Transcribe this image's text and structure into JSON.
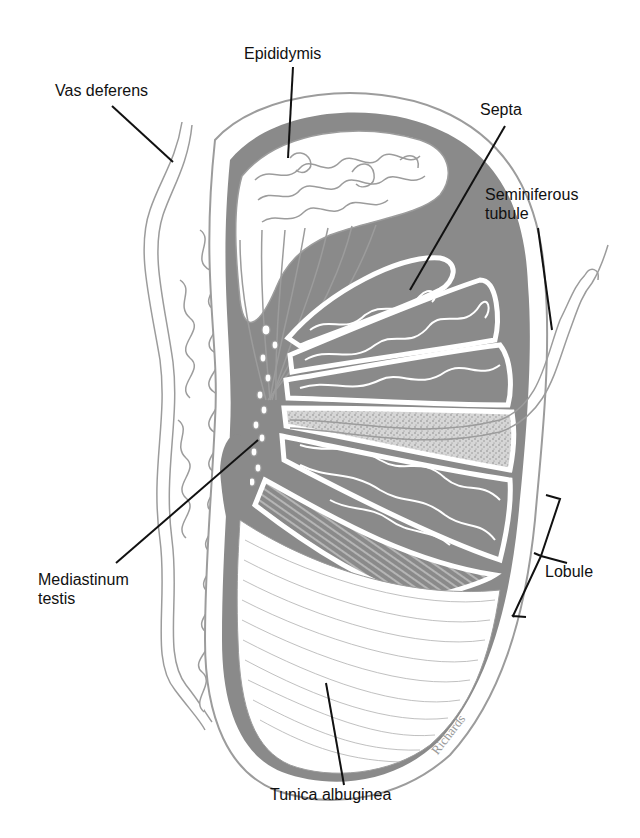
{
  "diagram": {
    "colors": {
      "tunica_fill": "#8a8a8a",
      "outline": "#9c9c9c",
      "leader_line": "#111111",
      "text": "#111111",
      "background": "#ffffff",
      "signature": "#9a9a9a"
    },
    "labels": {
      "epididymis": "Epididymis",
      "vas_deferens": "Vas deferens",
      "septa": "Septa",
      "seminiferous_tubule": "Seminiferous\ntubule",
      "lobule": "Lobule",
      "mediastinum_testis": "Mediastinum\ntestis",
      "tunica_albuginea": "Tunica albuginea"
    },
    "signature": "Richards"
  }
}
